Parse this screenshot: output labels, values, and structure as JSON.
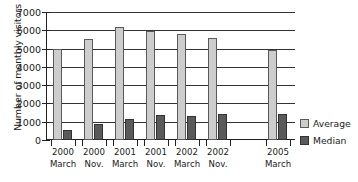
{
  "chart_data": {
    "type": "bar",
    "title": "",
    "xlabel": "",
    "ylabel": "Number of monthly visitors",
    "ylim": [
      0,
      7000
    ],
    "yticks": [
      0,
      1000,
      2000,
      3000,
      4000,
      5000,
      6000,
      7000
    ],
    "ytick_labels": [
      "0",
      "1000",
      "2000",
      "3000",
      "4000",
      "5000",
      "6000",
      "7000"
    ],
    "grid": true,
    "legend_position": "right",
    "categories": [
      "2000 March",
      "2000 Nov.",
      "2001 March",
      "2001 Nov.",
      "2002 March",
      "2002 Nov.",
      "2005 March"
    ],
    "category_lines": [
      [
        "2000",
        "March"
      ],
      [
        "2000",
        "Nov."
      ],
      [
        "2001",
        "March"
      ],
      [
        "2001",
        "Nov."
      ],
      [
        "2002",
        "March"
      ],
      [
        "2002",
        "Nov."
      ],
      [
        "2005",
        "March"
      ]
    ],
    "series": [
      {
        "name": "Average",
        "color": "#cdcdcd",
        "values": [
          5000,
          5550,
          6200,
          5980,
          5780,
          5600,
          4900
        ]
      },
      {
        "name": "Median",
        "color": "#5a5a5a",
        "values": [
          550,
          880,
          1130,
          1380,
          1330,
          1400,
          1450
        ]
      }
    ],
    "note": "axis break between 2002 Nov. and 2005 March"
  },
  "legend": {
    "items": [
      {
        "label": "Average",
        "swatch": "average"
      },
      {
        "label": "Median",
        "swatch": "median"
      }
    ]
  }
}
